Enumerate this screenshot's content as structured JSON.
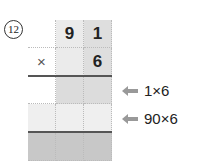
{
  "problem": {
    "number": "12",
    "top_digits": [
      "",
      "9",
      "1"
    ],
    "operator_row": [
      "×",
      "",
      "6"
    ],
    "hints": [
      {
        "label": "1×6"
      },
      {
        "label": "90×6"
      }
    ]
  },
  "colors": {
    "cell_light": "#ebebeb",
    "cell_mid": "#dcdcdc",
    "cell_dark": "#c8c8c8",
    "cell_pale": "#efefef",
    "arrow": "#999999"
  }
}
